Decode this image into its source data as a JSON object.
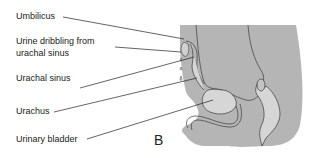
{
  "figure": {
    "panel_letter": "B",
    "labels": [
      {
        "id": "umbilicus",
        "text": "Umbilicus"
      },
      {
        "id": "urine-dribbling-1",
        "text": "Urine dribbling from"
      },
      {
        "id": "urine-dribbling-2",
        "text": "urachal sinus"
      },
      {
        "id": "urachal-sinus",
        "text": "Urachal sinus"
      },
      {
        "id": "urachus",
        "text": "Urachus"
      },
      {
        "id": "urinary-bladder",
        "text": "Urinary bladder"
      }
    ],
    "colors": {
      "body_fill": "#b5b5b5",
      "organ_fill": "#d6d6d6",
      "outline": "#3a3a3a",
      "leader_line": "#222222"
    }
  }
}
